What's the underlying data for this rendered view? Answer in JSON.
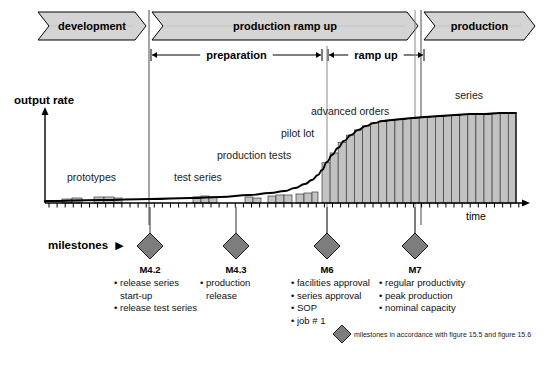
{
  "phases": [
    {
      "id": "development",
      "label": "development",
      "x": 38,
      "w": 108
    },
    {
      "id": "production-ramp-up",
      "label": "production ramp up",
      "x": 152,
      "w": 266
    },
    {
      "id": "production",
      "label": "production",
      "x": 424,
      "w": 111
    }
  ],
  "brackets": [
    {
      "id": "preparation",
      "label": "preparation",
      "x1": 151,
      "x2": 322
    },
    {
      "id": "ramp-up",
      "label": "ramp up",
      "x1": 328,
      "x2": 424
    }
  ],
  "axes": {
    "y_title": "output rate",
    "x_title": "time"
  },
  "curve_labels": [
    {
      "id": "prototypes",
      "label": "prototypes",
      "x": 67,
      "y": 172
    },
    {
      "id": "test-series",
      "label": "test series",
      "x": 174,
      "y": 172
    },
    {
      "id": "production-tests",
      "label": "production tests",
      "x": 217,
      "y": 150
    },
    {
      "id": "pilot-lot",
      "label": "pilot lot",
      "x": 281,
      "y": 128
    },
    {
      "id": "advanced-orders",
      "label": "advanced orders",
      "x": 311,
      "y": 106
    },
    {
      "id": "series",
      "label": "series",
      "x": 455,
      "y": 90
    }
  ],
  "milestones": [
    {
      "id": "m42",
      "name": "M4.2",
      "x": 150,
      "bullets": [
        "• release series",
        "start-up",
        "• release test series"
      ],
      "indent": [
        false,
        true,
        false
      ]
    },
    {
      "id": "m43",
      "name": "M4.3",
      "x": 236,
      "bullets": [
        "• production",
        "release"
      ],
      "indent": [
        false,
        true
      ]
    },
    {
      "id": "m6",
      "name": "M6",
      "x": 327,
      "bullets": [
        "• facilities approval",
        "• series approval",
        "• SOP",
        "• job # 1"
      ],
      "indent": [
        false,
        false,
        false,
        false
      ]
    },
    {
      "id": "m7",
      "name": "M7",
      "x": 415,
      "bullets": [
        "• regular productivity",
        "• peak production",
        "• nominal capacity"
      ],
      "indent": [
        false,
        false,
        false
      ]
    }
  ],
  "milestones_label": "milestones",
  "legend": {
    "text": "milestones in accordance with figure 15.5 and figure 15.6"
  },
  "colors": {
    "banner_fill": "#d4d4d4",
    "banner_stroke": "#000000",
    "bar_fill": "#c2c2c2",
    "bar_stroke": "#3a3a3a",
    "diamond_fill": "#7d7d7d",
    "diamond_stroke": "#1a1a1a",
    "curve": "#000000",
    "axis": "#000000",
    "divider": "#4a4a4a",
    "connector": "#8a8a8a"
  },
  "chart_data": {
    "type": "area",
    "xlabel": "time",
    "ylabel": "output rate",
    "grid": false,
    "legend_position": "none",
    "axis_x_range": [
      45,
      528
    ],
    "axis_y_baseline": 203,
    "note": "S-shaped cumulative output curve with vertical hatch bars; sparse low bars during development/preparation, steep ramp between M6 and M7, plateau in series production",
    "early_bars": [
      {
        "x": 62,
        "w": 10,
        "h": 4
      },
      {
        "x": 72,
        "w": 10,
        "h": 5
      },
      {
        "x": 94,
        "w": 10,
        "h": 6
      },
      {
        "x": 104,
        "w": 10,
        "h": 6
      },
      {
        "x": 114,
        "w": 8,
        "h": 5
      },
      {
        "x": 193,
        "w": 8,
        "h": 6
      },
      {
        "x": 201,
        "w": 8,
        "h": 7
      },
      {
        "x": 209,
        "w": 8,
        "h": 6
      },
      {
        "x": 245,
        "w": 8,
        "h": 6
      },
      {
        "x": 253,
        "w": 8,
        "h": 5
      },
      {
        "x": 268,
        "w": 8,
        "h": 7
      },
      {
        "x": 276,
        "w": 8,
        "h": 8
      },
      {
        "x": 284,
        "w": 8,
        "h": 8
      },
      {
        "x": 296,
        "w": 8,
        "h": 9
      },
      {
        "x": 304,
        "w": 8,
        "h": 10
      },
      {
        "x": 312,
        "w": 6,
        "h": 11
      }
    ],
    "ramp_bars_start_x": 322,
    "ramp_bars_end_x": 516,
    "ramp_bar_pitch": 8.1,
    "curve_points": [
      [
        45,
        201
      ],
      [
        100,
        200
      ],
      [
        150,
        199
      ],
      [
        190,
        198
      ],
      [
        220,
        197
      ],
      [
        250,
        195
      ],
      [
        270,
        193
      ],
      [
        285,
        191
      ],
      [
        295,
        188
      ],
      [
        305,
        184
      ],
      [
        312,
        180
      ],
      [
        318,
        175
      ],
      [
        322,
        170
      ],
      [
        327,
        162
      ],
      [
        332,
        155
      ],
      [
        338,
        148
      ],
      [
        344,
        141
      ],
      [
        351,
        135
      ],
      [
        358,
        130
      ],
      [
        366,
        126
      ],
      [
        374,
        123
      ],
      [
        383,
        121
      ],
      [
        392,
        120
      ],
      [
        402,
        119
      ],
      [
        412,
        118
      ],
      [
        425,
        117
      ],
      [
        440,
        116
      ],
      [
        455,
        115
      ],
      [
        470,
        114
      ],
      [
        485,
        114
      ],
      [
        500,
        113
      ],
      [
        516,
        113
      ]
    ]
  }
}
